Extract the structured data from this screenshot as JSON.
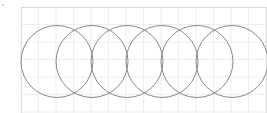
{
  "diagram": {
    "type": "overlapping-circles",
    "frame": {
      "x": 21,
      "y": 7,
      "width": 245,
      "height": 110,
      "border_color": "#dddddd"
    },
    "grid": {
      "spacing": 17.5,
      "color": "#eeeeee",
      "origin_x": 21,
      "origin_y": 7
    },
    "circles": {
      "count": 6,
      "radius": 36,
      "center_y": 61.5,
      "first_center_x": 57,
      "spacing_x": 35,
      "stroke": "#8a8a8a",
      "stroke_width": 1,
      "fill": "none"
    },
    "marker": {
      "x": 3,
      "y": 5,
      "color": "#cccccc"
    }
  }
}
